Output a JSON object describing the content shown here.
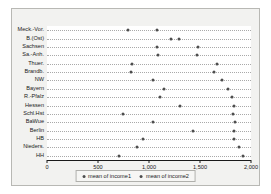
{
  "chart_data": {
    "type": "scatter",
    "title": "",
    "subtitle": "",
    "xlabel": "",
    "ylabel": "",
    "xlim": [
      0,
      2000
    ],
    "xticks": [
      0,
      500,
      1000,
      1500,
      2000
    ],
    "xticklabels": [
      "0",
      "500",
      "1,000",
      "1,500",
      "2,000"
    ],
    "grid": true,
    "grid_orientation": "horizontal",
    "grid_style": "dotted",
    "legend_position": "bottom",
    "marker": "circle",
    "marker_color": "#4d4d4d",
    "plot_background": "#ffffff",
    "figure_background": "#f2f2f0",
    "categories": [
      "Meck.-Vor.",
      "B.(Ost)",
      "Sachsen",
      "Sa.-Anh.",
      "Thuer.",
      "Brandb.",
      "NW",
      "Bayern",
      "R.-Pfalz",
      "Hessen",
      "Schl.Hst",
      "BaWue",
      "Berlin",
      "HB",
      "Nieders.",
      "HH"
    ],
    "series": [
      {
        "name": "mean of income1",
        "color": "#4d4d4d",
        "values": [
          795,
          1215,
          1080,
          1090,
          835,
          825,
          1040,
          1145,
          1110,
          1305,
          745,
          1040,
          1430,
          940,
          880,
          705
        ]
      },
      {
        "name": "mean of income2",
        "color": "#4d4d4d",
        "values": [
          1080,
          1295,
          1480,
          1470,
          1665,
          1635,
          1715,
          1775,
          1815,
          1835,
          1825,
          1845,
          1835,
          1835,
          1885,
          1925
        ]
      }
    ]
  }
}
